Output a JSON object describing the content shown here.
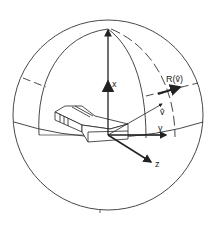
{
  "diagram": {
    "type": "sphere-coordinate-frame",
    "labels": {
      "x_axis": "x",
      "y_axis": "y",
      "z_axis": "z",
      "v_vector": "v̂",
      "r_vector": "R(v̂)"
    },
    "colors": {
      "stroke": "#222222",
      "background": "#ffffff"
    }
  }
}
